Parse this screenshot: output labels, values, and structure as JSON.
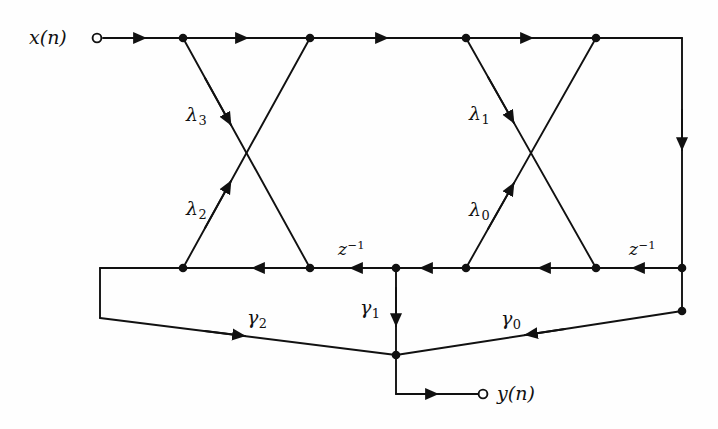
{
  "diagram": {
    "stroke_color": "#111111",
    "background_color": "#fefefe",
    "io": {
      "input_label": "x(n)",
      "input_var": "x",
      "input_arg": "(n)",
      "output_label": "y(n)",
      "output_var": "y",
      "output_arg": "(n)"
    },
    "delays": [
      {
        "name": "delay-left",
        "base": "z",
        "exponent": "−1",
        "label": "z⁻¹"
      },
      {
        "name": "delay-right",
        "base": "z",
        "exponent": "−1",
        "label": "z⁻¹"
      }
    ],
    "lattice_coefficients": [
      {
        "name": "lambda-3",
        "base": "λ",
        "index": "3",
        "label": "λ₃"
      },
      {
        "name": "lambda-2",
        "base": "λ",
        "index": "2",
        "label": "λ₂"
      },
      {
        "name": "lambda-1",
        "base": "λ",
        "index": "1",
        "label": "λ₁"
      },
      {
        "name": "lambda-0",
        "base": "λ",
        "index": "0",
        "label": "λ₀"
      }
    ],
    "ladder_coefficients": [
      {
        "name": "gamma-2",
        "base": "γ",
        "index": "2",
        "label": "γ₂"
      },
      {
        "name": "gamma-1",
        "base": "γ",
        "index": "1",
        "label": "γ₁"
      },
      {
        "name": "gamma-0",
        "base": "γ",
        "index": "0",
        "label": "γ₀"
      }
    ]
  }
}
